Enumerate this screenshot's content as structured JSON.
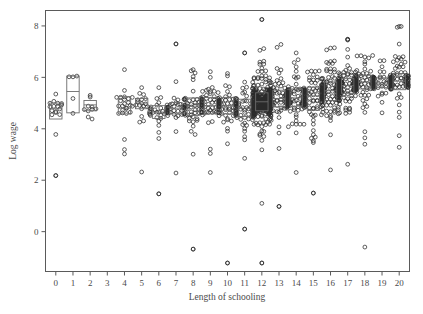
{
  "chart_data": {
    "type": "scatter",
    "title": "",
    "xlabel": "Length of schooling",
    "ylabel": "Log wage",
    "xlim": [
      -0.6,
      20.6
    ],
    "ylim": [
      -1.55,
      8.6
    ],
    "xticks": [
      0,
      1,
      2,
      3,
      4,
      5,
      6,
      7,
      8,
      9,
      10,
      11,
      12,
      13,
      14,
      15,
      16,
      17,
      18,
      19,
      20
    ],
    "yticks": [
      0,
      2,
      4,
      6,
      8
    ],
    "grid": false,
    "legend": null,
    "marker": "open-circle",
    "overlay": "boxplot",
    "series": [
      {
        "name": "Log wage by length of schooling",
        "categories": [
          0,
          1,
          2,
          3,
          4,
          5,
          6,
          7,
          8,
          9,
          10,
          11,
          12,
          13,
          14,
          15,
          16,
          17,
          18,
          19,
          20
        ],
        "boxes": [
          {
            "x": 0,
            "min": 2.18,
            "q1": 4.38,
            "median": 4.78,
            "q3": 5.0,
            "max": 5.35,
            "n": 14
          },
          {
            "x": 1,
            "min": 4.6,
            "q1": 4.62,
            "median": 5.45,
            "q3": 6.05,
            "max": 6.05,
            "n": 3
          },
          {
            "x": 2,
            "min": 4.38,
            "q1": 4.7,
            "median": 4.93,
            "q3": 5.1,
            "max": 5.3,
            "n": 8
          },
          {
            "x": 3,
            "min": null,
            "q1": null,
            "median": null,
            "q3": null,
            "max": null,
            "n": 0
          },
          {
            "x": 4,
            "min": 3.02,
            "q1": 4.58,
            "median": 4.8,
            "q3": 5.25,
            "max": 6.3,
            "n": 22
          },
          {
            "x": 5,
            "min": 2.32,
            "q1": 4.78,
            "median": 5.0,
            "q3": 5.18,
            "max": 5.6,
            "n": 18
          },
          {
            "x": 6,
            "min": 1.47,
            "q1": 4.4,
            "median": 4.65,
            "q3": 4.9,
            "max": 5.6,
            "n": 30
          },
          {
            "x": 7,
            "min": 2.28,
            "q1": 4.58,
            "median": 4.8,
            "q3": 5.02,
            "max": 7.3,
            "n": 34
          },
          {
            "x": 8,
            "min": -0.68,
            "q1": 4.52,
            "median": 4.88,
            "q3": 5.2,
            "max": 6.3,
            "n": 52
          },
          {
            "x": 9,
            "min": 2.3,
            "q1": 4.58,
            "median": 4.9,
            "q3": 5.22,
            "max": 6.22,
            "n": 55
          },
          {
            "x": 10,
            "min": -1.22,
            "q1": 4.58,
            "median": 4.9,
            "q3": 5.22,
            "max": 6.15,
            "n": 60
          },
          {
            "x": 11,
            "min": 0.1,
            "q1": 4.48,
            "median": 4.8,
            "q3": 5.15,
            "max": 6.95,
            "n": 58
          },
          {
            "x": 12,
            "min": -1.22,
            "q1": 4.7,
            "median": 5.05,
            "q3": 5.4,
            "max": 8.25,
            "n": 330
          },
          {
            "x": 13,
            "min": 0.98,
            "q1": 4.85,
            "median": 5.18,
            "q3": 5.5,
            "max": 7.28,
            "n": 95
          },
          {
            "x": 14,
            "min": 2.3,
            "q1": 4.88,
            "median": 5.2,
            "q3": 5.55,
            "max": 6.95,
            "n": 105
          },
          {
            "x": 15,
            "min": 1.5,
            "q1": 4.72,
            "median": 5.28,
            "q3": 5.62,
            "max": 6.25,
            "n": 70
          },
          {
            "x": 16,
            "min": 2.4,
            "q1": 5.1,
            "median": 5.48,
            "q3": 5.82,
            "max": 7.15,
            "n": 150
          },
          {
            "x": 17,
            "min": 2.62,
            "q1": 5.38,
            "median": 5.68,
            "q3": 5.95,
            "max": 7.48,
            "n": 120
          },
          {
            "x": 18,
            "min": 3.4,
            "q1": 5.55,
            "median": 5.82,
            "q3": 6.08,
            "max": 6.85,
            "n": 80
          },
          {
            "x": 19,
            "min": 4.62,
            "q1": 5.6,
            "median": 5.78,
            "q3": 5.98,
            "max": 6.65,
            "n": 45
          },
          {
            "x": 20,
            "min": 3.28,
            "q1": 5.52,
            "median": 5.85,
            "q3": 6.15,
            "max": 7.98,
            "n": 90
          }
        ],
        "notable_points": [
          {
            "x": 0,
            "y": 2.18,
            "note": "low outlier"
          },
          {
            "x": 0,
            "y": 3.78,
            "note": "low outlier"
          },
          {
            "x": 6,
            "y": 1.47,
            "note": "low outlier"
          },
          {
            "x": 7,
            "y": 7.3,
            "note": "high outlier"
          },
          {
            "x": 8,
            "y": -0.68,
            "note": "low outlier"
          },
          {
            "x": 10,
            "y": -1.22,
            "note": "lowest value"
          },
          {
            "x": 11,
            "y": 0.1,
            "note": "low outlier"
          },
          {
            "x": 11,
            "y": 6.95,
            "note": "high outlier"
          },
          {
            "x": 12,
            "y": 8.25,
            "note": "highest value"
          },
          {
            "x": 12,
            "y": -1.22,
            "note": "lowest value"
          },
          {
            "x": 12,
            "y": 1.1,
            "note": "low outlier"
          },
          {
            "x": 13,
            "y": 0.98,
            "note": "low outlier"
          },
          {
            "x": 15,
            "y": 1.5,
            "note": "low outlier"
          },
          {
            "x": 17,
            "y": 7.48,
            "note": "high outlier"
          },
          {
            "x": 18,
            "y": -0.6,
            "note": "low outlier"
          },
          {
            "x": 20,
            "y": 7.98,
            "note": "high outlier"
          }
        ]
      }
    ]
  },
  "axes": {
    "x_title": "Length of schooling",
    "y_title": "Log wage",
    "x_tick_labels": [
      "0",
      "1",
      "2",
      "3",
      "4",
      "5",
      "6",
      "7",
      "8",
      "9",
      "10",
      "11",
      "12",
      "13",
      "14",
      "15",
      "16",
      "17",
      "18",
      "19",
      "20"
    ],
    "y_tick_labels": [
      "0",
      "2",
      "4",
      "6",
      "8"
    ]
  },
  "style": {
    "frame_color": "#5a5a5a",
    "marker_color": "#2b2b2b",
    "box_color": "#6b6b6b",
    "background": "#ffffff"
  }
}
